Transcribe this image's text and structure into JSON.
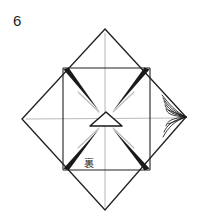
{
  "figure": {
    "step_number": "6",
    "caption_mark": "裏",
    "mark_meaning": "back-side",
    "background_color": "#ffffff",
    "ink_color": "#231f20",
    "crease_color": "#b8b8b8",
    "wedge_color": "#1a1a1a"
  },
  "geometry": {
    "outer_diamond": {
      "name": "outer-diamond",
      "top": [
        105,
        29
      ],
      "right": [
        186,
        117
      ],
      "bottom": [
        105,
        210
      ],
      "left": [
        22,
        119
      ],
      "stroke_width": 1.3
    },
    "inner_square": {
      "name": "inner-square",
      "top_left": [
        63,
        68
      ],
      "top_right": [
        150,
        68
      ],
      "bottom_right": [
        150,
        170
      ],
      "bottom_left": [
        63,
        170
      ],
      "stroke_width": 1.1
    },
    "center_triangle": {
      "name": "center-triangle",
      "apex": [
        106,
        112
      ],
      "left_base": [
        90,
        125
      ],
      "right_base": [
        122,
        125
      ],
      "stroke_width": 1.4
    },
    "crease_lines": [
      {
        "name": "crease-vertical",
        "from": [
          105,
          33
        ],
        "to": [
          105,
          207
        ]
      },
      {
        "name": "crease-horizontal",
        "from": [
          26,
          119
        ],
        "to": [
          182,
          118
        ]
      },
      {
        "name": "crease-diagonal-nw",
        "from": [
          78,
          92
        ],
        "to": [
          99,
          112
        ]
      },
      {
        "name": "crease-diagonal-ne",
        "from": [
          134,
          92
        ],
        "to": [
          113,
          112
        ]
      },
      {
        "name": "crease-diagonal-sw",
        "from": [
          78,
          148
        ],
        "to": [
          99,
          128
        ]
      },
      {
        "name": "crease-diagonal-se",
        "from": [
          134,
          148
        ],
        "to": [
          113,
          128
        ]
      }
    ],
    "corner_wedges": [
      {
        "name": "wedge-top-left",
        "tip": [
          99,
          110
        ],
        "base_a": [
          64,
          70
        ],
        "base_b": [
          69,
          68
        ]
      },
      {
        "name": "wedge-top-right",
        "tip": [
          113,
          110
        ],
        "base_a": [
          149,
          70
        ],
        "base_b": [
          144,
          68
        ]
      },
      {
        "name": "wedge-bottom-left",
        "tip": [
          99,
          130
        ],
        "base_a": [
          64,
          168
        ],
        "base_b": [
          69,
          170
        ]
      },
      {
        "name": "wedge-bottom-right",
        "tip": [
          113,
          130
        ],
        "base_a": [
          149,
          168
        ],
        "base_b": [
          144,
          170
        ]
      }
    ],
    "pleat_fan": {
      "name": "pleat-fan-right-vertex",
      "vertex": [
        186,
        117
      ],
      "line_count": 7,
      "spread_top": [
        160,
        96
      ],
      "spread_bottom": [
        160,
        140
      ]
    }
  },
  "labels": {
    "step_label_name": "step-number",
    "back_mark_name": "back-side-indicator"
  }
}
